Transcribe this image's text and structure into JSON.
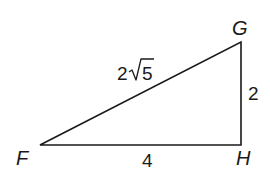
{
  "diagram": {
    "type": "right-triangle",
    "vertices": {
      "F": "F",
      "G": "G",
      "H": "H"
    },
    "sides": {
      "FG": {
        "coefficient": "2",
        "radical": "√",
        "radicand": "5",
        "value_text": "2√5"
      },
      "GH": {
        "value_text": "2"
      },
      "FH": {
        "value_text": "4"
      }
    },
    "right_angle_at": "H",
    "stroke_color": "#1a1a1a"
  }
}
